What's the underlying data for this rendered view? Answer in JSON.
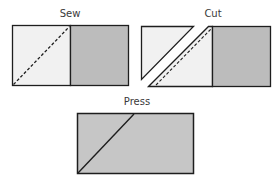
{
  "diagram": {
    "steps": [
      {
        "id": "sew",
        "label": "Sew",
        "description": "Two squares side by side, light square with dashed diagonal seam line"
      },
      {
        "id": "cut",
        "label": "Cut",
        "description": "Light square cut along diagonal beside the stitched seam"
      },
      {
        "id": "press",
        "label": "Press",
        "description": "Pressed rectangle with diagonal seam"
      }
    ],
    "colors": {
      "light_fabric": "#f1f1f1",
      "dark_fabric": "#bcbcbc",
      "pressed_fabric": "#c6c6c6",
      "outline": "#1e1e1e"
    }
  }
}
